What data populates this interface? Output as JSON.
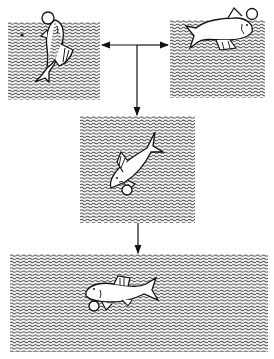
{
  "diagram": {
    "colors": {
      "ink": "#111111",
      "background": "#ffffff",
      "water": "#555555"
    },
    "panels": [
      {
        "id": "top-left",
        "fish": "fish-vertical-head-up",
        "bubble": true,
        "x": 8,
        "y": 22,
        "w": 92,
        "h": 78
      },
      {
        "id": "top-right",
        "fish": "fish-horizontal-head-right",
        "bubble": true,
        "x": 170,
        "y": 20,
        "w": 95,
        "h": 78
      },
      {
        "id": "middle",
        "fish": "fish-diagonal-head-down-left",
        "bubble": true,
        "x": 80,
        "y": 116,
        "w": 115,
        "h": 107
      },
      {
        "id": "bottom",
        "fish": "fish-horizontal-head-left",
        "bubble": true,
        "x": 10,
        "y": 254,
        "w": 258,
        "h": 98
      }
    ],
    "arrows": [
      {
        "from": "junction",
        "to": "top-left"
      },
      {
        "from": "junction",
        "to": "top-right"
      },
      {
        "from": "junction",
        "to": "middle"
      },
      {
        "from": "middle",
        "to": "bottom"
      }
    ]
  }
}
